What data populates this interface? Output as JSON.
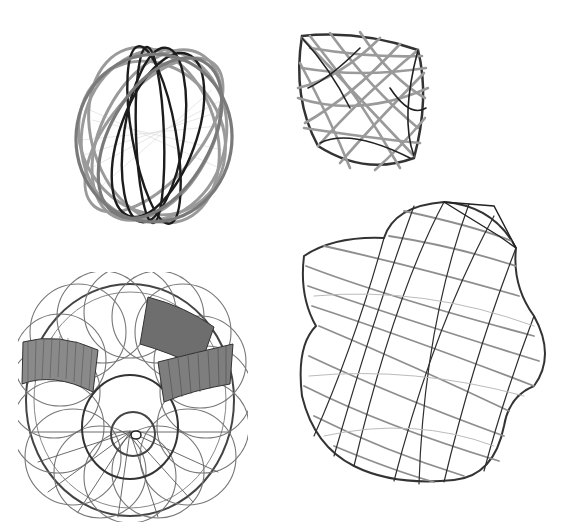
{
  "figures": [
    {
      "id": "egg-cage",
      "description": "ellipsoidal cage of interlaced elliptical tube loops",
      "stroke_dark": "#1c1c1c",
      "stroke_light": "#9a9a9a"
    },
    {
      "id": "cushion-cage",
      "description": "rounded box-like lattice of crossing tubes",
      "stroke_dark": "#222222",
      "stroke_light": "#a8a8a8"
    },
    {
      "id": "torus-lattice",
      "description": "torus lattice with two ribbon bands",
      "stroke_dark": "#333333",
      "stroke_light": "#8c8c8c"
    },
    {
      "id": "twisted-tube",
      "description": "twisted lobed tube lattice",
      "stroke_dark": "#2a2a2a",
      "stroke_light": "#9c9c9c"
    }
  ],
  "background": "#ffffff"
}
